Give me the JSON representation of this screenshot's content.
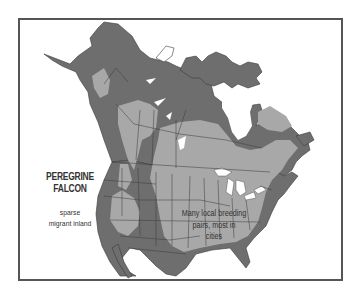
{
  "map": {
    "title_line1": "PEREGRINE",
    "title_line2": "FALCON",
    "annotations": {
      "sparse_line1": "sparse",
      "sparse_line2": "migrant inland",
      "breeding_line1": "Many local breeding",
      "breeding_line2": "pairs, most in",
      "breeding_line3": "cities"
    },
    "region": "North America",
    "colors": {
      "background": "#ffffff",
      "frame": "#555555",
      "dark_range": "#6e6e6e",
      "light_range": "#a8a8a8",
      "borders": "#3a3a3a",
      "water": "#ffffff"
    }
  }
}
